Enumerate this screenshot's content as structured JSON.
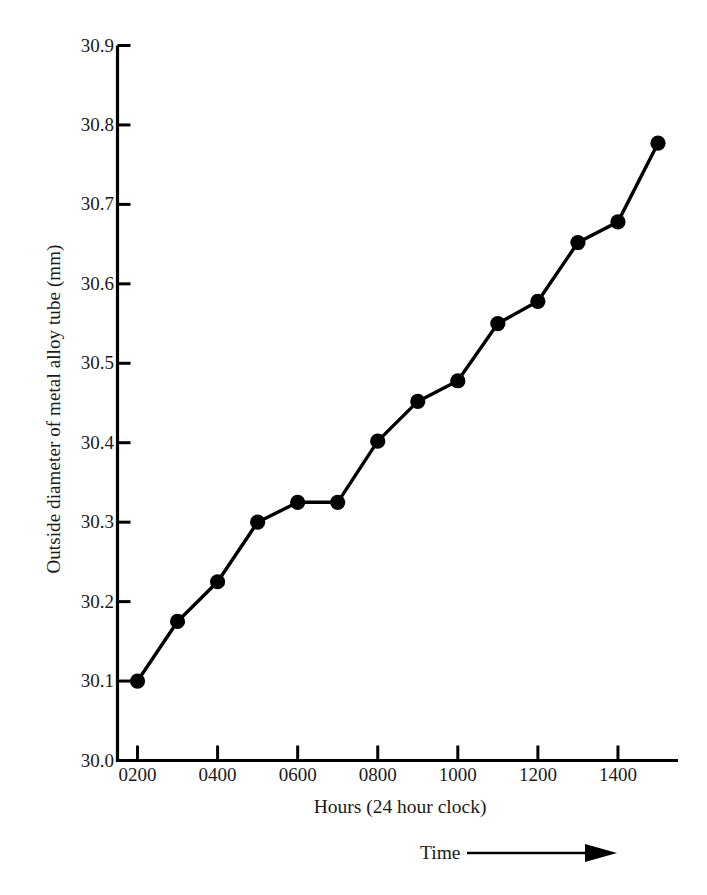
{
  "chart_data": {
    "type": "line",
    "title": "",
    "xlabel": "Hours (24 hour clock)",
    "ylabel": "Outside diameter of metal alloy tube (mm)",
    "annotation": "Time",
    "annotation_icon": "right-arrow-icon",
    "x": [
      200,
      300,
      400,
      500,
      600,
      700,
      800,
      900,
      1000,
      1100,
      1200,
      1300,
      1400,
      1500
    ],
    "xtick_labels": [
      "0200",
      "0400",
      "0600",
      "0800",
      "1000",
      "1200",
      "1400"
    ],
    "xticks": [
      200,
      400,
      600,
      800,
      1000,
      1200,
      1400
    ],
    "xlim": [
      150,
      1530
    ],
    "values": [
      30.1,
      30.175,
      30.225,
      30.3,
      30.325,
      30.325,
      30.402,
      30.452,
      30.478,
      30.55,
      30.578,
      30.652,
      30.678,
      30.777
    ],
    "ytick_labels": [
      "30.9",
      "30.8",
      "30.7",
      "30.6",
      "30.5",
      "30.4",
      "30.3",
      "30.2",
      "30.1",
      "30.0"
    ],
    "yticks": [
      30.9,
      30.8,
      30.7,
      30.6,
      30.5,
      30.4,
      30.3,
      30.2,
      30.1,
      30.0
    ],
    "ylim": [
      30.0,
      30.9
    ],
    "grid": false,
    "legend": false,
    "marker": "filled-circle",
    "series_color": "#000000",
    "axis_color": "#000000"
  }
}
